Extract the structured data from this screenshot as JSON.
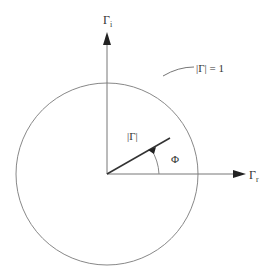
{
  "diagram": {
    "axes": {
      "imaginary": {
        "label_main": "Γ",
        "label_sub": "i"
      },
      "real": {
        "label_main": "Γ",
        "label_sub": "r"
      }
    },
    "circle": {
      "label": "|Γ| = 1"
    },
    "vector": {
      "magnitude_label": "|Γ|",
      "angle_label": "Φ"
    },
    "colors": {
      "stroke": "#555555",
      "thin_stroke": "#888888",
      "text": "#333333"
    }
  }
}
